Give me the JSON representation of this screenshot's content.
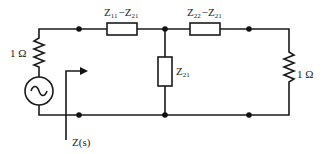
{
  "diagram": {
    "type": "circuit",
    "source": {
      "symbol": "ac-source",
      "series_resistor": "1 Ω"
    },
    "load": {
      "resistor": "1 Ω"
    },
    "series_impedance_left": {
      "main": "Z",
      "sub1": "11",
      "minus": "−",
      "main2": "Z",
      "sub2": "21"
    },
    "series_impedance_right": {
      "main": "Z",
      "sub1": "22",
      "minus": "−",
      "main2": "Z",
      "sub2": "21"
    },
    "shunt_impedance": {
      "main": "Z",
      "sub": "21"
    },
    "input_impedance_label": "Z(s)",
    "colors": {
      "line": "#1a1a1a",
      "background": "#ffffff"
    }
  }
}
